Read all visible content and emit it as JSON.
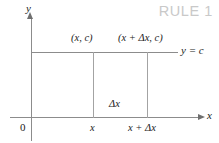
{
  "figure": {
    "heading": "RULE 1",
    "heading_color": "#c9c9c9",
    "line_color": "#8c8c8c",
    "text_color": "#1b1b1b",
    "background": "#ffffff"
  },
  "axes": {
    "y_label": "y",
    "x_label": "x",
    "origin_label": "0"
  },
  "labels": {
    "point_left": "(x, c)",
    "point_right": "(x + Δx, c)",
    "function_line": "y = c",
    "delta": "Δx",
    "tick_x": "x",
    "tick_x_plus_dx": "x + Δx"
  },
  "chart_data": {
    "type": "line",
    "title": "RULE 1",
    "subtitle": "",
    "xlabel": "x",
    "ylabel": "y",
    "grid": false,
    "legend": "none",
    "annotations": [
      "(x, c)",
      "(x + Δx, c)",
      "y = c",
      "Δx",
      "0",
      "x",
      "x + Δx"
    ],
    "series": [
      {
        "name": "y = c",
        "description": "constant function, horizontal line at height c",
        "x": [
          0,
          1
        ],
        "values": [
          1,
          1
        ]
      }
    ],
    "markers": [
      {
        "label": "(x, c)",
        "x": 0.42,
        "y": 1
      },
      {
        "label": "(x + Δx, c)",
        "x": 0.72,
        "y": 1
      }
    ],
    "xticks": [
      "0",
      "x",
      "x + Δx"
    ],
    "yticks": [],
    "xlim": [
      0,
      1
    ],
    "ylim": [
      0,
      1.6
    ]
  }
}
